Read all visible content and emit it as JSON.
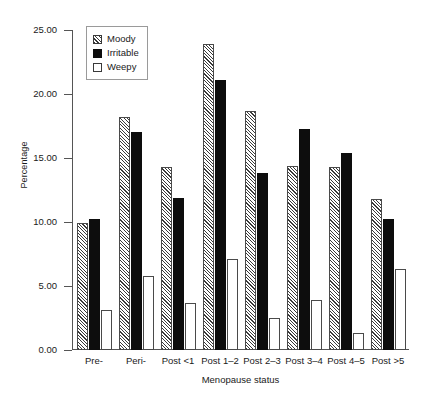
{
  "chart_data": {
    "type": "bar",
    "title": "",
    "xlabel": "Menopause status",
    "ylabel": "Percentage",
    "ylim": [
      0,
      25
    ],
    "yticks": [
      "0.00",
      "5.00",
      "10.00",
      "15.00",
      "20.00",
      "25.00"
    ],
    "ytick_values": [
      0,
      5,
      10,
      15,
      20,
      25
    ],
    "grid": false,
    "legend_position": "top-left",
    "categories": [
      "Pre-",
      "Peri-",
      "Post <1",
      "Post 1–2",
      "Post 2–3",
      "Post 3–4",
      "Post 4–5",
      "Post >5"
    ],
    "series": [
      {
        "name": "Moody",
        "pattern": "diagonal-hatch",
        "color": "#3a3a3a",
        "values": [
          9.9,
          18.2,
          14.3,
          23.9,
          18.7,
          14.4,
          14.3,
          11.8
        ]
      },
      {
        "name": "Irritable",
        "pattern": "solid-black",
        "color": "#0d0d0d",
        "values": [
          10.2,
          17.0,
          11.9,
          21.1,
          13.8,
          17.3,
          15.4,
          10.2
        ]
      },
      {
        "name": "Weepy",
        "pattern": "white-outline",
        "color": "#ffffff",
        "values": [
          3.1,
          5.8,
          3.7,
          7.1,
          2.5,
          3.9,
          1.3,
          6.3
        ]
      }
    ]
  }
}
